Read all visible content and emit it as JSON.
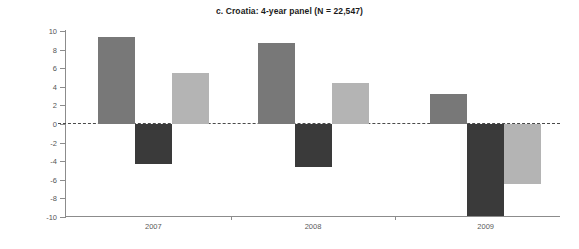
{
  "chart_data": {
    "type": "bar",
    "title": "c. Croatia: 4-year panel (N = 22,547)",
    "xlabel": "",
    "ylabel": "Percent",
    "categories": [
      "2007",
      "2008",
      "2009"
    ],
    "ylim": [
      -10,
      10
    ],
    "ytick_labels": [
      "10",
      "8",
      "6",
      "4",
      "2",
      "0",
      "-2",
      "-4",
      "-6",
      "-8",
      "-10"
    ],
    "ytick_values": [
      10,
      8,
      6,
      4,
      2,
      0,
      -2,
      -4,
      -6,
      -8,
      -10
    ],
    "grid": false,
    "legend": "none",
    "zero_reference_line": true,
    "series": [
      {
        "name": "series-1",
        "color": "#787878",
        "values": [
          9.4,
          8.7,
          3.2
        ]
      },
      {
        "name": "series-2",
        "color": "#3a3a3a",
        "values": [
          -4.3,
          -4.6,
          -9.9
        ]
      },
      {
        "name": "series-3",
        "color": "#b4b4b4",
        "values": [
          5.5,
          4.4,
          -6.5
        ]
      }
    ]
  }
}
